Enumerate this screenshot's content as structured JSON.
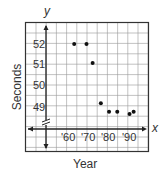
{
  "chart_data": {
    "type": "scatter",
    "title": "",
    "xlabel": "Year",
    "ylabel": "Seconds",
    "x_axis_letter": "x",
    "y_axis_letter": "y",
    "x_tick_labels": [
      "'60",
      "'70",
      "'80",
      "'90"
    ],
    "y_tick_labels": [
      "49",
      "50",
      "51",
      "52"
    ],
    "y_axis_break": true,
    "grid": true,
    "points": [
      {
        "x": 1964,
        "y": 52.0
      },
      {
        "x": 1970,
        "y": 52.0
      },
      {
        "x": 1973,
        "y": 51.1
      },
      {
        "x": 1977,
        "y": 49.2
      },
      {
        "x": 1981,
        "y": 48.8
      },
      {
        "x": 1985,
        "y": 48.8
      },
      {
        "x": 1991,
        "y": 48.7
      },
      {
        "x": 1993,
        "y": 48.8
      }
    ]
  }
}
